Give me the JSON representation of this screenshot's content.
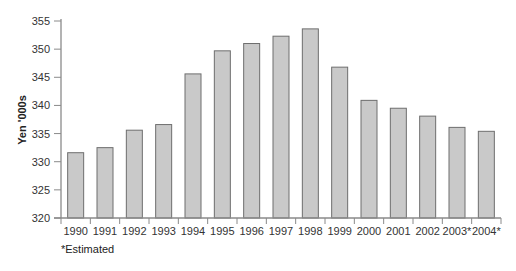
{
  "chart_data": {
    "type": "bar",
    "title": "",
    "xlabel": "",
    "ylabel": "Yen '000s",
    "ylim": [
      320,
      355
    ],
    "yticks": [
      320,
      325,
      330,
      335,
      340,
      345,
      350,
      355
    ],
    "grid": false,
    "legend": null,
    "categories": [
      "1990",
      "1991",
      "1992",
      "1993",
      "1994",
      "1995",
      "1996",
      "1997",
      "1998",
      "1999",
      "2000",
      "2001",
      "2002",
      "2003*",
      "2004*"
    ],
    "values": [
      331.6,
      332.5,
      335.6,
      336.6,
      345.6,
      349.7,
      351.0,
      352.3,
      353.6,
      346.8,
      340.9,
      339.5,
      338.1,
      336.1,
      335.4
    ],
    "footnote": "*Estimated",
    "colors": {
      "bar_fill": "#c9c9c9",
      "bar_stroke": "#6e6e6e",
      "axis": "#8a8a8a"
    }
  }
}
